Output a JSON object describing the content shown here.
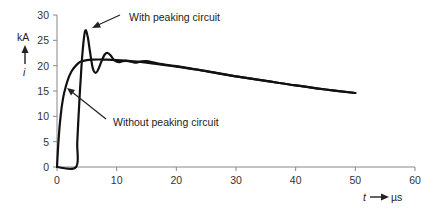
{
  "chart_data": {
    "type": "line",
    "title": "",
    "xlabel": "t",
    "xunit": "µs",
    "ylabel": "i",
    "yunit": "kA",
    "xlim": [
      0,
      60
    ],
    "ylim": [
      0,
      30
    ],
    "x_ticks": [
      0,
      10,
      20,
      30,
      40,
      50,
      60
    ],
    "y_ticks": [
      0,
      5,
      10,
      15,
      20,
      25,
      30
    ],
    "grid": false,
    "legend": "annotations with arrows",
    "series": [
      {
        "name": "Without peaking circuit",
        "x": [
          0,
          0.3,
          0.6,
          1.0,
          1.5,
          2.0,
          2.5,
          3.0,
          3.5,
          4.0,
          5.0,
          6.0,
          8.0,
          10,
          15,
          20,
          25,
          30,
          35,
          40,
          45,
          50
        ],
        "y": [
          0,
          6,
          10,
          13.5,
          16,
          17.8,
          19,
          19.8,
          20.4,
          20.8,
          21.1,
          21.2,
          21.2,
          21.1,
          20.6,
          19.8,
          18.9,
          17.9,
          17.0,
          16.1,
          15.3,
          14.6
        ]
      },
      {
        "name": "With peaking circuit",
        "x": [
          0,
          3.2,
          3.4,
          3.7,
          4.0,
          4.3,
          4.7,
          5.1,
          5.5,
          6.0,
          6.5,
          7.0,
          7.5,
          8.0,
          8.5,
          9.0,
          9.5,
          10,
          10.5,
          11,
          12,
          13,
          14,
          15,
          17,
          20,
          25,
          30,
          35,
          40,
          45,
          50
        ],
        "y": [
          0,
          0,
          5,
          12,
          18,
          23,
          26.8,
          26,
          23,
          19.5,
          18.6,
          19.5,
          21,
          22.2,
          22.5,
          22,
          21.2,
          20.8,
          20.7,
          20.9,
          20.9,
          20.6,
          20.8,
          20.9,
          20.4,
          19.9,
          18.9,
          17.9,
          17.0,
          16.1,
          15.3,
          14.6
        ]
      }
    ],
    "annotations": [
      {
        "text": "With peaking circuit",
        "points_to": {
          "x": 4.7,
          "y": 26.5
        }
      },
      {
        "text": "Without peaking circuit",
        "points_to": {
          "x": 1.2,
          "y": 15
        }
      }
    ]
  },
  "labels": {
    "y_unit": "kA",
    "y_symbol": "i",
    "x_symbol": "t",
    "x_unit": "µs",
    "annotation_with": "With peaking circuit",
    "annotation_without": "Without peaking circuit"
  }
}
